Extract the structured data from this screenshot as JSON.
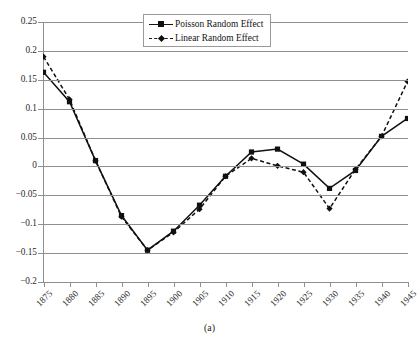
{
  "figure": {
    "caption": "(a)",
    "background_color": "#ffffff",
    "axis_color": "#8f8f8f",
    "series_color": "#101010"
  },
  "legend": {
    "position": "top-center",
    "entries": [
      {
        "label": "Poisson Random Effect",
        "style": "solid",
        "marker": "square"
      },
      {
        "label": "Linear Random Effect",
        "style": "dashed",
        "marker": "diamond"
      }
    ]
  },
  "yaxis": {
    "ticks": [
      "0.25",
      "0.2",
      "0.15",
      "0.1",
      "0.05",
      "0",
      "−0.05",
      "−0.1",
      "−0.15",
      "−0.2"
    ],
    "values": [
      0.25,
      0.2,
      0.15,
      0.1,
      0.05,
      0,
      -0.05,
      -0.1,
      -0.15,
      -0.2
    ],
    "min": -0.2,
    "max": 0.25,
    "step": 0.05
  },
  "xaxis": {
    "ticks": [
      "1875",
      "1880",
      "1885",
      "1890",
      "1895",
      "1900",
      "1905",
      "1910",
      "1915",
      "1920",
      "1925",
      "1930",
      "1935",
      "1940",
      "1945"
    ],
    "label_rotation": -45
  },
  "chart_data": {
    "type": "line",
    "title": "",
    "subtitle": "",
    "xlabel": "",
    "ylabel": "",
    "caption": "(a)",
    "grid": true,
    "legend_position": "top-center",
    "x": [
      1875,
      1880,
      1885,
      1890,
      1895,
      1900,
      1905,
      1910,
      1915,
      1920,
      1925,
      1930,
      1935,
      1940,
      1945
    ],
    "categories": [
      "1875",
      "1880",
      "1885",
      "1890",
      "1895",
      "1900",
      "1905",
      "1910",
      "1915",
      "1920",
      "1925",
      "1930",
      "1935",
      "1940",
      "1945"
    ],
    "xlim": [
      1875,
      1945
    ],
    "ylim": [
      -0.2,
      0.25
    ],
    "yticks": [
      -0.2,
      -0.15,
      -0.1,
      -0.05,
      0,
      0.05,
      0.1,
      0.15,
      0.2,
      0.25
    ],
    "series": [
      {
        "name": "Poisson Random Effect",
        "style": "solid",
        "marker": "square",
        "color": "#101010",
        "values": [
          0.163,
          0.112,
          0.01,
          -0.085,
          -0.145,
          -0.112,
          -0.067,
          -0.017,
          0.025,
          0.03,
          0.004,
          -0.038,
          -0.007,
          0.052,
          0.083
        ]
      },
      {
        "name": "Linear Random Effect",
        "style": "dashed",
        "marker": "diamond",
        "color": "#101010",
        "values": [
          0.19,
          0.116,
          0.01,
          -0.087,
          -0.145,
          -0.114,
          -0.074,
          -0.017,
          0.014,
          0.001,
          -0.01,
          -0.073,
          -0.005,
          0.052,
          0.147
        ]
      }
    ]
  }
}
